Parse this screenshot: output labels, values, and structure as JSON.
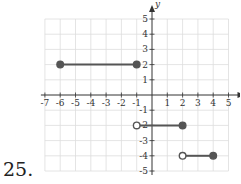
{
  "problem_number": "25.",
  "chart_data": {
    "type": "line",
    "title": "",
    "xlabel": "x",
    "ylabel": "y",
    "xlim": [
      -7,
      5
    ],
    "ylim": [
      -5,
      5
    ],
    "grid": true,
    "x_ticks": [
      "-7",
      "-6",
      "-5",
      "-4",
      "-3",
      "-2",
      "-1",
      "1",
      "2",
      "3",
      "4",
      "5"
    ],
    "y_ticks": [
      "5",
      "4",
      "3",
      "2",
      "1",
      "-1",
      "-2",
      "-3",
      "-4",
      "-5"
    ],
    "segments": [
      {
        "x0": -6,
        "y0": 2,
        "x1": -1,
        "y1": 2,
        "start_closed": true,
        "end_closed": true
      },
      {
        "x0": -1,
        "y0": -2,
        "x1": 2,
        "y1": -2,
        "start_closed": false,
        "end_closed": true
      },
      {
        "x0": 2,
        "y0": -4,
        "x1": 4,
        "y1": -4,
        "start_closed": false,
        "end_closed": true
      }
    ],
    "colors": {
      "line": "#555555",
      "grid": "#dddddd",
      "axis": "#333333"
    }
  }
}
